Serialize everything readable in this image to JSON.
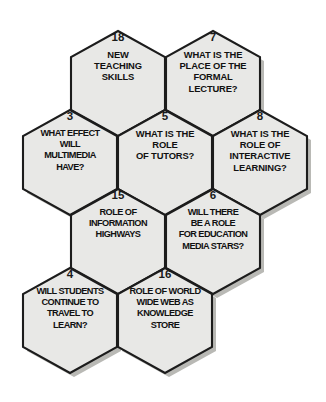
{
  "diagram": {
    "background_color": "#ffffff",
    "hex_fill_color": "#e8e8e6",
    "hex_stroke_color": "#1c1c1c",
    "shadow_color": "#b9b9b5",
    "cells": [
      {
        "id": "hex-18",
        "number": "18",
        "text": "NEW\nTEACHING\nSKILLS",
        "row": 1,
        "column": 1
      },
      {
        "id": "hex-7",
        "number": "7",
        "text": "WHAT IS THE\nPLACE OF THE\nFORMAL\nLECTURE?",
        "row": 1,
        "column": 2
      },
      {
        "id": "hex-3",
        "number": "3",
        "text": "WHAT EFFECT\nWILL\nMULTIMEDIA\nHAVE?",
        "row": 2,
        "column": 1
      },
      {
        "id": "hex-5",
        "number": "5",
        "text": "WHAT IS THE\nROLE\nOF TUTORS?",
        "row": 2,
        "column": 2
      },
      {
        "id": "hex-8",
        "number": "8",
        "text": "WHAT IS THE\nROLE OF\nINTERACTIVE\nLEARNING?",
        "row": 2,
        "column": 3
      },
      {
        "id": "hex-15",
        "number": "15",
        "text": "ROLE OF\nINFORMATION\nHIGHWAYS",
        "row": 3,
        "column": 1
      },
      {
        "id": "hex-6",
        "number": "6",
        "text": "WILL THERE\nBE A ROLE\nFOR EDUCATION\nMEDIA STARS?",
        "row": 3,
        "column": 2
      },
      {
        "id": "hex-4",
        "number": "4",
        "text": "WILL STUDENTS\nCONTINUE TO\nTRAVEL TO\nLEARN?",
        "row": 4,
        "column": 1
      },
      {
        "id": "hex-16",
        "number": "16",
        "text": "ROLE OF WORLD\nWIDE WEB AS\nKNOWLEDGE\nSTORE",
        "row": 4,
        "column": 2
      }
    ]
  }
}
